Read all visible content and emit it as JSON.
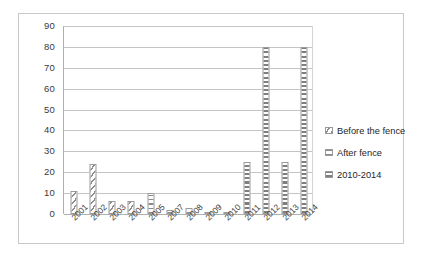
{
  "chart_data": {
    "type": "bar",
    "title": "",
    "xlabel": "",
    "ylabel": "",
    "ylim": [
      0,
      90
    ],
    "ytick_step": 10,
    "grid": true,
    "legend_position": "right",
    "categories": [
      "2001",
      "2002",
      "2003",
      "2004",
      "2005",
      "2007",
      "2008",
      "2009",
      "2010",
      "2011",
      "2012",
      "2013",
      "2014"
    ],
    "yticks": [
      "90",
      "80",
      "70",
      "60",
      "50",
      "40",
      "30",
      "20",
      "10",
      "0"
    ],
    "series": [
      {
        "name": "Before the fence",
        "pattern": "diagonal-hatch",
        "values": [
          11,
          24,
          6,
          6,
          null,
          null,
          null,
          null,
          null,
          null,
          null,
          null,
          null
        ]
      },
      {
        "name": "After fence",
        "pattern": "horizontal-hatch",
        "values": [
          null,
          null,
          null,
          null,
          10,
          2,
          3,
          1,
          1,
          null,
          null,
          null,
          null
        ]
      },
      {
        "name": "2010-2014",
        "pattern": "checkered",
        "values": [
          null,
          null,
          null,
          null,
          null,
          null,
          null,
          null,
          1,
          25,
          80,
          25,
          80
        ]
      }
    ],
    "values_combined": [
      11,
      24,
      6,
      6,
      10,
      2,
      3,
      1,
      1,
      25,
      80,
      25,
      80
    ],
    "legend": [
      {
        "label": "Before the fence",
        "pattern": "diagonal-hatch"
      },
      {
        "label": "After fence",
        "pattern": "horizontal-hatch"
      },
      {
        "label": "2010-2014",
        "pattern": "checkered"
      }
    ],
    "colors": {
      "bar_outline": "#9a9a9a",
      "bar_pattern": "#8a8a8a",
      "gridline": "#c4c4c4",
      "axis": "#b0b0b0",
      "frame": "#c9c9c9",
      "text": "#3a3a3a",
      "background": "#ffffff"
    }
  }
}
